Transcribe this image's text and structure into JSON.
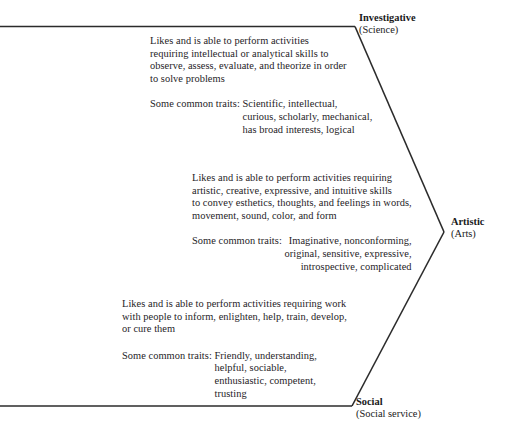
{
  "diagram": {
    "line_color": "#2b2b2b",
    "background": "#ffffff",
    "shape": "open chevron (arrow) pointing right"
  },
  "types": [
    {
      "key": "investigative",
      "name": "Investigative",
      "subtitle": "(Science)",
      "description": [
        "Likes and is able to perform activities",
        "requiring intellectual or analytical skills to",
        "observe, assess, evaluate, and theorize in order",
        "to solve problems"
      ],
      "traits_label": "Some common traits:",
      "traits_lines": [
        "Scientific, intellectual,",
        "curious, scholarly, mechanical,",
        "has broad interests, logical"
      ]
    },
    {
      "key": "artistic",
      "name": "Artistic",
      "subtitle": "(Arts)",
      "description": [
        "Likes and is able to perform activities requiring",
        "artistic, creative, expressive, and intuitive skills",
        "to convey esthetics, thoughts, and feelings in words,",
        "movement, sound, color, and form"
      ],
      "traits_label": "Some common traits:",
      "traits_lines": [
        "Imaginative, nonconforming,",
        "original, sensitive, expressive,",
        "introspective, complicated"
      ]
    },
    {
      "key": "social",
      "name": "Social",
      "subtitle": "(Social service)",
      "description": [
        "Likes and is able to perform activities requiring work",
        "with people to inform, enlighten, help, train, develop,",
        "or cure them"
      ],
      "traits_label": "Some common traits:",
      "traits_lines": [
        "Friendly, understanding,",
        "helpful, sociable,",
        "enthusiastic, competent,",
        "trusting"
      ]
    }
  ]
}
